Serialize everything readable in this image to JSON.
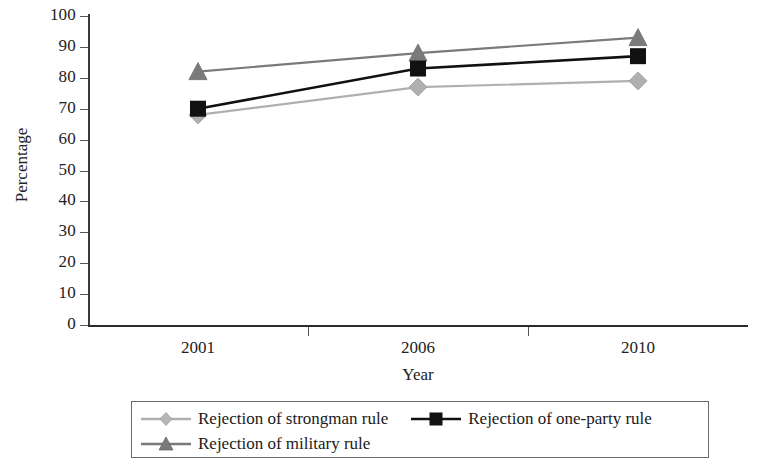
{
  "chart_data": {
    "type": "line",
    "title": "",
    "xlabel": "Year",
    "ylabel": "Percentage",
    "categories": [
      "2001",
      "2006",
      "2010"
    ],
    "x": [
      2001,
      2006,
      2010
    ],
    "ylim": [
      0,
      100
    ],
    "y_ticks": [
      0,
      10,
      20,
      30,
      40,
      50,
      60,
      70,
      80,
      90,
      100
    ],
    "y_tick_labels": [
      "0",
      "10",
      "20",
      "30",
      "40",
      "50",
      "60",
      "70",
      "80",
      "90",
      "100"
    ],
    "grid": false,
    "legend_position": "bottom",
    "series": [
      {
        "name": "Rejection of strongman rule",
        "values": [
          68,
          77,
          79
        ],
        "marker": "diamond",
        "color": "#b0b0b0"
      },
      {
        "name": "Rejection of one-party rule",
        "values": [
          70,
          83,
          87
        ],
        "marker": "square",
        "color": "#111111"
      },
      {
        "name": "Rejection of military rule",
        "values": [
          82,
          88,
          93
        ],
        "marker": "triangle",
        "color": "#7a7a7a"
      }
    ]
  },
  "legend": {
    "entries": [
      {
        "label": "Rejection of strongman rule",
        "marker": "diamond-marker",
        "color": "#b0b0b0"
      },
      {
        "label": "Rejection of one-party rule",
        "marker": "square-marker",
        "color": "#111111"
      },
      {
        "label": "Rejection of military rule",
        "marker": "triangle-marker",
        "color": "#7a7a7a"
      }
    ]
  }
}
